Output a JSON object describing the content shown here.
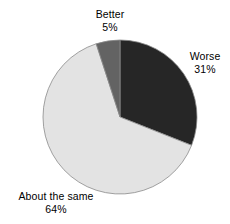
{
  "chart_data": {
    "type": "pie",
    "title": "",
    "subtitle": "",
    "xlabel": "",
    "ylabel": "",
    "legend_position": "none",
    "grid": false,
    "start_angle_deg": 0,
    "direction": "clockwise",
    "center": {
      "cx": 120,
      "cy": 117,
      "r": 77
    },
    "categories": [
      "Worse",
      "About the same",
      "Better"
    ],
    "values": [
      31,
      64,
      5
    ],
    "value_suffix": "%",
    "slices": [
      {
        "label": "Worse",
        "value": 31,
        "value_text": "31%",
        "color": "#262626",
        "start_deg": 0,
        "end_deg": 111.6
      },
      {
        "label": "About the same",
        "value": 64,
        "value_text": "64%",
        "color": "#e3e3e3",
        "start_deg": 111.6,
        "end_deg": 342.0
      },
      {
        "label": "Better",
        "value": 5,
        "value_text": "5%",
        "color": "#636363",
        "start_deg": 342.0,
        "end_deg": 360.0
      }
    ],
    "outline_color": "#8a8a8a",
    "background": "#ffffff"
  },
  "labels": {
    "better": {
      "name": "Better",
      "value": "5%"
    },
    "worse": {
      "name": "Worse",
      "value": "31%"
    },
    "about_the_same": {
      "name": "About the same",
      "value": "64%"
    }
  }
}
